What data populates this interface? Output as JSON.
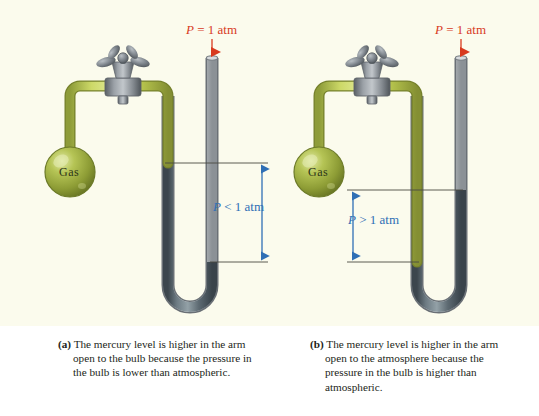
{
  "figure": {
    "background_color": "#fbfbed",
    "page_color": "#ffffff"
  },
  "colors": {
    "atm_label": "#d83a1e",
    "pressure_label": "#2f6fb5",
    "mercury": "#5a6a72",
    "glass_tube": "#c9ccd1",
    "green_tube": "#c3d24a",
    "bulb": "#9aab3e",
    "stopcock": "#7d8289",
    "caption_text": "#231f20",
    "level_line": "#4a4a42"
  },
  "panels": [
    {
      "id": "panel-a",
      "tag": "(a)",
      "atm_label": {
        "symbol": "P",
        "text": " = 1 atm",
        "full": "P = 1 atm",
        "arrow_direction": "down"
      },
      "bulb_label": "Gas",
      "pressure_label": {
        "symbol": "P",
        "text": " < 1 atm",
        "full": "P < 1 atm"
      },
      "mercury_higher_in": "arm open to the bulb",
      "bulb_pressure": "lower than atmospheric",
      "caption": "The mercury level is higher in the arm open to the bulb because the pressure in the bulb is lower than atmospheric."
    },
    {
      "id": "panel-b",
      "tag": "(b)",
      "atm_label": {
        "symbol": "P",
        "text": " = 1 atm",
        "full": "P = 1 atm",
        "arrow_direction": "down"
      },
      "bulb_label": "Gas",
      "pressure_label": {
        "symbol": "P",
        "text": " > 1 atm",
        "full": "P > 1 atm"
      },
      "mercury_higher_in": "arm open to the atmosphere",
      "bulb_pressure": "higher than atmospheric",
      "caption": "The mercury level is higher in the arm open to the atmosphere because the pressure in the bulb is higher than atmospheric."
    }
  ]
}
